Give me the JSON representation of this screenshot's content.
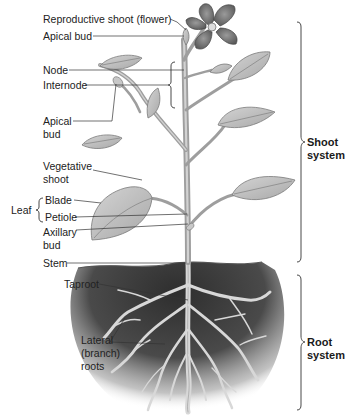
{
  "figure": {
    "colors": {
      "background": "#ffffff",
      "leaf": "#bdbdbd",
      "leaf_vein": "#8a8a8a",
      "stem": "#a9a9a9",
      "flower": "#6e6e6e",
      "soil_dark": "#3a3a3a",
      "root": "#cfcfcf",
      "label_text": "#222222",
      "leader_line": "#333333"
    }
  },
  "labels": {
    "reproductive_shoot": "Reproductive shoot (flower)",
    "apical_bud_top": "Apical bud",
    "node": "Node",
    "internode": "Internode",
    "apical_bud_side_line1": "Apical",
    "apical_bud_side_line2": "bud",
    "vegetative_shoot_line1": "Vegetative",
    "vegetative_shoot_line2": "shoot",
    "leaf": "Leaf",
    "blade": "Blade",
    "petiole": "Petiole",
    "axillary_bud_line1": "Axillary",
    "axillary_bud_line2": "bud",
    "stem": "Stem",
    "taproot": "Taproot",
    "lateral_roots_line1": "Lateral",
    "lateral_roots_line2": "(branch)",
    "lateral_roots_line3": "roots"
  },
  "systems": {
    "shoot_line1": "Shoot",
    "shoot_line2": "system",
    "root_line1": "Root",
    "root_line2": "system"
  }
}
